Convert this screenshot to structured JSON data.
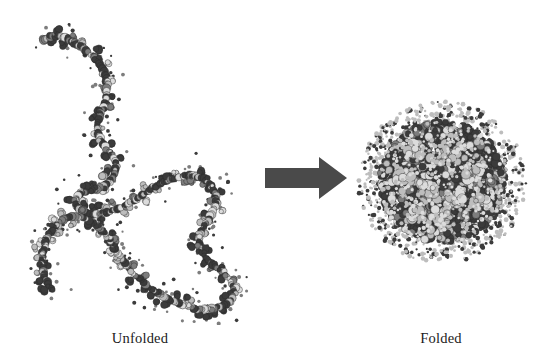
{
  "figure": {
    "background_color": "#ffffff",
    "width": 534,
    "height": 356
  },
  "labels": {
    "left": "Unfolded",
    "right": "Folded"
  },
  "arrow": {
    "name": "folding-transition-arrow",
    "direction": "right",
    "color": "#4a4a4a"
  },
  "palette": {
    "atom_dark": "#3b3b3b",
    "atom_mid": "#7d7d7d",
    "atom_light": "#bdbdbd",
    "atom_pale": "#dcdcdc",
    "outline": "#2a2a2a",
    "arrow": "#4a4a4a",
    "text": "#1b1b1b"
  },
  "structures": {
    "unfolded": {
      "name": "unfolded-polypeptide-chain",
      "representation": "space-filling",
      "description": "Extended, irregular polypeptide chain winding through an S-shaped path with two open loops",
      "backbone_path": [
        [
          44,
          40
        ],
        [
          56,
          36
        ],
        [
          70,
          40
        ],
        [
          84,
          49
        ],
        [
          96,
          60
        ],
        [
          104,
          72
        ],
        [
          107,
          86
        ],
        [
          106,
          100
        ],
        [
          101,
          112
        ],
        [
          97,
          124
        ],
        [
          99,
          136
        ],
        [
          105,
          147
        ],
        [
          112,
          156
        ],
        [
          116,
          166
        ],
        [
          113,
          176
        ],
        [
          107,
          184
        ],
        [
          100,
          188
        ],
        [
          92,
          190
        ],
        [
          84,
          192
        ],
        [
          78,
          196
        ],
        [
          76,
          203
        ],
        [
          80,
          210
        ],
        [
          89,
          214
        ],
        [
          100,
          214
        ],
        [
          112,
          211
        ],
        [
          124,
          206
        ],
        [
          136,
          199
        ],
        [
          148,
          191
        ],
        [
          160,
          184
        ],
        [
          172,
          179
        ],
        [
          184,
          176
        ],
        [
          196,
          176
        ],
        [
          206,
          180
        ],
        [
          213,
          188
        ],
        [
          216,
          198
        ],
        [
          214,
          209
        ],
        [
          209,
          219
        ],
        [
          203,
          228
        ],
        [
          199,
          238
        ],
        [
          200,
          248
        ],
        [
          206,
          258
        ],
        [
          215,
          267
        ],
        [
          225,
          275
        ],
        [
          232,
          284
        ],
        [
          234,
          294
        ],
        [
          229,
          302
        ],
        [
          219,
          307
        ],
        [
          207,
          309
        ],
        [
          194,
          308
        ],
        [
          181,
          304
        ],
        [
          168,
          299
        ],
        [
          156,
          292
        ],
        [
          145,
          284
        ],
        [
          135,
          275
        ],
        [
          126,
          265
        ],
        [
          118,
          254
        ],
        [
          111,
          243
        ],
        [
          104,
          233
        ],
        [
          96,
          225
        ],
        [
          86,
          219
        ],
        [
          75,
          217
        ],
        [
          64,
          219
        ],
        [
          55,
          226
        ],
        [
          48,
          236
        ],
        [
          44,
          248
        ],
        [
          42,
          260
        ],
        [
          43,
          272
        ],
        [
          47,
          282
        ],
        [
          52,
          290
        ]
      ]
    },
    "folded": {
      "name": "folded-globular-protein",
      "representation": "space-filling",
      "description": "Compact spherical globule of densely packed residues with a fuzzy halo of surface atoms",
      "center": [
        87,
        87
      ],
      "core_radius": 62,
      "halo_radius": 84
    }
  }
}
